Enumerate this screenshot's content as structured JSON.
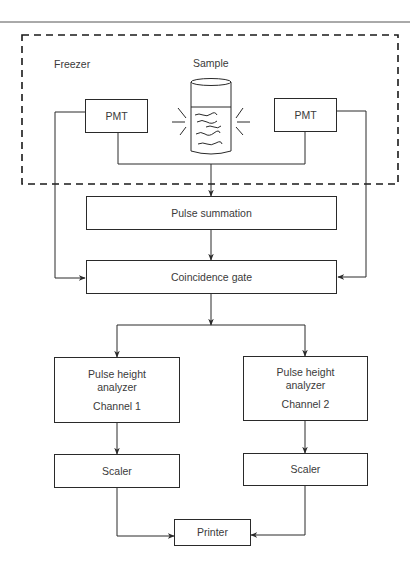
{
  "diagram": {
    "region_label": "Freezer",
    "sample_label": "Sample",
    "nodes": {
      "pmt_left": "PMT",
      "pmt_right": "PMT",
      "pulse_summation": "Pulse summation",
      "coincidence_gate": "Coincidence gate",
      "pha_1": {
        "line1": "Pulse height",
        "line2": "analyzer",
        "line3": "Channel 1"
      },
      "pha_2": {
        "line1": "Pulse height",
        "line2": "analyzer",
        "line3": "Channel 2"
      },
      "scaler_1": "Scaler",
      "scaler_2": "Scaler",
      "printer": "Printer"
    },
    "edges": [
      {
        "from": "pmt_left",
        "to": "pulse_summation"
      },
      {
        "from": "pmt_right",
        "to": "pulse_summation"
      },
      {
        "from": "pmt_left",
        "to": "coincidence_gate"
      },
      {
        "from": "pmt_right",
        "to": "coincidence_gate"
      },
      {
        "from": "pulse_summation",
        "to": "coincidence_gate"
      },
      {
        "from": "coincidence_gate",
        "to": "pha_1"
      },
      {
        "from": "coincidence_gate",
        "to": "pha_2"
      },
      {
        "from": "pha_1",
        "to": "scaler_1"
      },
      {
        "from": "pha_2",
        "to": "scaler_2"
      },
      {
        "from": "scaler_1",
        "to": "printer"
      },
      {
        "from": "scaler_2",
        "to": "printer"
      }
    ],
    "colors": {
      "line": "#2a2a2a",
      "text": "#3a3a3a",
      "background": "#ffffff"
    }
  }
}
